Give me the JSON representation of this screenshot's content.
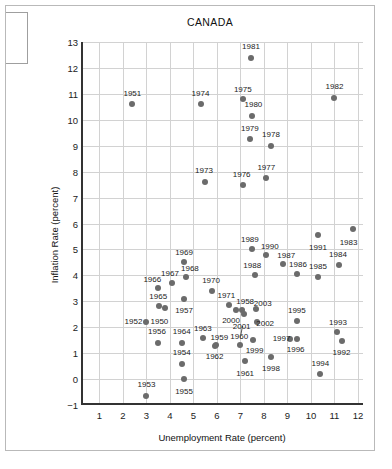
{
  "chart_data": {
    "type": "scatter",
    "title": "CANADA",
    "xlabel": "Unemployment Rate (percent)",
    "ylabel": "Inflation Rate (percent)",
    "xlim": [
      0.3,
      12.3
    ],
    "ylim": [
      -1,
      13
    ],
    "xticks": [
      1,
      2,
      3,
      4,
      5,
      6,
      7,
      8,
      9,
      10,
      11,
      12
    ],
    "yticks": [
      -1,
      0,
      1,
      2,
      3,
      4,
      5,
      6,
      7,
      8,
      9,
      10,
      11,
      12,
      13
    ],
    "grid": true,
    "legend": "none",
    "point_color": "#6b6b6b",
    "axis_color": "#333333",
    "grid_color": "#d2d2d2",
    "points": [
      {
        "label": "1950",
        "x": 3.8,
        "y": 2.75,
        "lx": 3.55,
        "ly": 2.25
      },
      {
        "label": "1951",
        "x": 2.4,
        "y": 10.6,
        "lx": 2.4,
        "ly": 11.05
      },
      {
        "label": "1952",
        "x": 3.0,
        "y": 2.2,
        "lx": 2.45,
        "ly": 2.25
      },
      {
        "label": "1953",
        "x": 3.0,
        "y": -0.65,
        "lx": 3.0,
        "ly": -0.2
      },
      {
        "label": "1954",
        "x": 4.5,
        "y": 0.6,
        "lx": 4.5,
        "ly": 1.05
      },
      {
        "label": "1955",
        "x": 4.6,
        "y": 0.0,
        "lx": 4.6,
        "ly": -0.45
      },
      {
        "label": "1956",
        "x": 3.5,
        "y": 1.4,
        "lx": 3.45,
        "ly": 1.85
      },
      {
        "label": "1957",
        "x": 4.6,
        "y": 3.1,
        "lx": 4.6,
        "ly": 2.65
      },
      {
        "label": "1958",
        "x": 7.05,
        "y": 2.65,
        "lx": 7.2,
        "ly": 3.0
      },
      {
        "label": "1959",
        "x": 5.95,
        "y": 1.3,
        "lx": 6.1,
        "ly": 1.62
      },
      {
        "label": "1960",
        "x": 7.0,
        "y": 1.3,
        "lx": 6.95,
        "ly": 1.68
      },
      {
        "label": "1961",
        "x": 7.2,
        "y": 0.7,
        "lx": 7.2,
        "ly": 0.25
      },
      {
        "label": "1962",
        "x": 5.9,
        "y": 1.28,
        "lx": 5.9,
        "ly": 0.9
      },
      {
        "label": "1963",
        "x": 5.4,
        "y": 1.6,
        "lx": 5.4,
        "ly": 1.98
      },
      {
        "label": "1964",
        "x": 4.5,
        "y": 1.4,
        "lx": 4.5,
        "ly": 1.85
      },
      {
        "label": "1965",
        "x": 3.55,
        "y": 2.8,
        "lx": 3.5,
        "ly": 3.2
      },
      {
        "label": "1966",
        "x": 3.5,
        "y": 3.5,
        "lx": 3.25,
        "ly": 3.85
      },
      {
        "label": "1967",
        "x": 4.1,
        "y": 3.7,
        "lx": 4.0,
        "ly": 4.1
      },
      {
        "label": "1968",
        "x": 4.7,
        "y": 3.95,
        "lx": 4.85,
        "ly": 4.28
      },
      {
        "label": "1969",
        "x": 4.6,
        "y": 4.5,
        "lx": 4.6,
        "ly": 4.9
      },
      {
        "label": "1970",
        "x": 5.8,
        "y": 3.4,
        "lx": 5.75,
        "ly": 3.82
      },
      {
        "label": "1971",
        "x": 6.5,
        "y": 2.85,
        "lx": 6.4,
        "ly": 3.25
      },
      {
        "label": "1973",
        "x": 5.5,
        "y": 7.6,
        "lx": 5.45,
        "ly": 8.05
      },
      {
        "label": "1974",
        "x": 5.3,
        "y": 10.6,
        "lx": 5.3,
        "ly": 11.05
      },
      {
        "label": "1975",
        "x": 7.1,
        "y": 10.8,
        "lx": 7.1,
        "ly": 11.2
      },
      {
        "label": "1976",
        "x": 7.1,
        "y": 7.5,
        "lx": 7.05,
        "ly": 7.92
      },
      {
        "label": "1977",
        "x": 8.1,
        "y": 7.75,
        "lx": 8.1,
        "ly": 8.18
      },
      {
        "label": "1978",
        "x": 8.3,
        "y": 9.0,
        "lx": 8.3,
        "ly": 9.45
      },
      {
        "label": "1979",
        "x": 7.4,
        "y": 9.25,
        "lx": 7.4,
        "ly": 9.68
      },
      {
        "label": "1980",
        "x": 7.5,
        "y": 10.15,
        "lx": 7.55,
        "ly": 10.6
      },
      {
        "label": "1981",
        "x": 7.45,
        "y": 12.4,
        "lx": 7.45,
        "ly": 12.85
      },
      {
        "label": "1982",
        "x": 11.0,
        "y": 10.85,
        "lx": 11.0,
        "ly": 11.3
      },
      {
        "label": "1983",
        "x": 11.8,
        "y": 5.8,
        "lx": 11.6,
        "ly": 5.3
      },
      {
        "label": "1984",
        "x": 11.2,
        "y": 4.4,
        "lx": 11.15,
        "ly": 4.82
      },
      {
        "label": "1985",
        "x": 10.3,
        "y": 3.95,
        "lx": 10.3,
        "ly": 4.35
      },
      {
        "label": "1986",
        "x": 9.4,
        "y": 4.05,
        "lx": 9.45,
        "ly": 4.42
      },
      {
        "label": "1987",
        "x": 8.8,
        "y": 4.45,
        "lx": 8.95,
        "ly": 4.8
      },
      {
        "label": "1988",
        "x": 7.6,
        "y": 4.0,
        "lx": 7.5,
        "ly": 4.4
      },
      {
        "label": "1989",
        "x": 7.5,
        "y": 5.0,
        "lx": 7.4,
        "ly": 5.42
      },
      {
        "label": "1990",
        "x": 8.1,
        "y": 4.8,
        "lx": 8.25,
        "ly": 5.15
      },
      {
        "label": "1991",
        "x": 10.3,
        "y": 5.55,
        "lx": 10.3,
        "ly": 5.1
      },
      {
        "label": "1992",
        "x": 11.3,
        "y": 1.45,
        "lx": 11.3,
        "ly": 1.05
      },
      {
        "label": "1993",
        "x": 11.1,
        "y": 1.8,
        "lx": 11.15,
        "ly": 2.2
      },
      {
        "label": "1994",
        "x": 10.4,
        "y": 0.2,
        "lx": 10.4,
        "ly": 0.63
      },
      {
        "label": "1995",
        "x": 9.4,
        "y": 2.25,
        "lx": 9.4,
        "ly": 2.68
      },
      {
        "label": "1996",
        "x": 9.4,
        "y": 1.55,
        "lx": 9.35,
        "ly": 1.15
      },
      {
        "label": "1997",
        "x": 9.1,
        "y": 1.55,
        "lx": 8.75,
        "ly": 1.6
      },
      {
        "label": "1998",
        "x": 8.3,
        "y": 0.85,
        "lx": 8.3,
        "ly": 0.42
      },
      {
        "label": "1999",
        "x": 7.55,
        "y": 1.5,
        "lx": 7.6,
        "ly": 1.12
      },
      {
        "label": "2000",
        "x": 6.8,
        "y": 2.65,
        "lx": 6.6,
        "ly": 2.28
      },
      {
        "label": "2001",
        "x": 7.15,
        "y": 2.5,
        "lx": 7.05,
        "ly": 2.03,
        "leader": true
      },
      {
        "label": "2002",
        "x": 7.7,
        "y": 2.2,
        "lx": 8.05,
        "ly": 2.18
      },
      {
        "label": "2003",
        "x": 7.65,
        "y": 2.7,
        "lx": 7.95,
        "ly": 2.95
      }
    ]
  }
}
